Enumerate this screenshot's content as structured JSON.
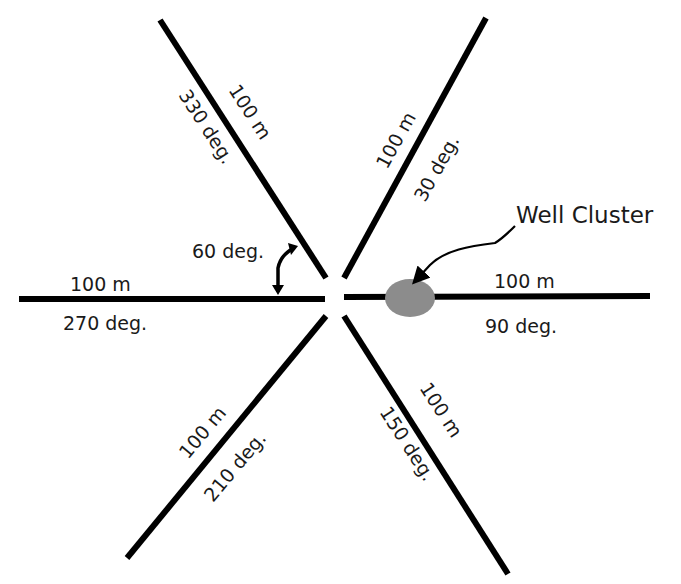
{
  "diagram": {
    "center": {
      "x": 336,
      "y": 296
    },
    "transects": [
      {
        "id": "330",
        "length_label": "100 m",
        "bearing_label": "330 deg."
      },
      {
        "id": "30",
        "length_label": "100 m",
        "bearing_label": "30 deg."
      },
      {
        "id": "90",
        "length_label": "100 m",
        "bearing_label": "90 deg."
      },
      {
        "id": "150",
        "length_label": "100 m",
        "bearing_label": "150 deg."
      },
      {
        "id": "210",
        "length_label": "100 m",
        "bearing_label": "210 deg."
      },
      {
        "id": "270",
        "length_label": "100 m",
        "bearing_label": "270 deg."
      }
    ],
    "angle_annotation": {
      "label": "60 deg."
    },
    "well_cluster": {
      "label": "Well Cluster",
      "fill_color": "#8c8c8c"
    },
    "line_color": "#000000"
  }
}
